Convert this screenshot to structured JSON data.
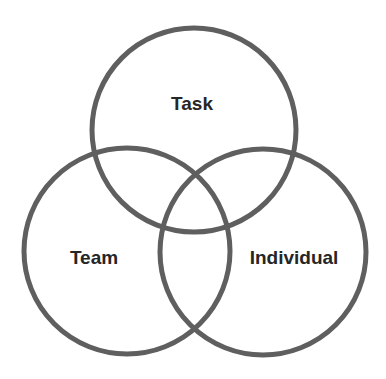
{
  "diagram": {
    "type": "venn",
    "colors": {
      "background": "#ffffff",
      "stroke": "#5f5f5f",
      "text": "#262626"
    },
    "circles": [
      {
        "id": "task",
        "label": "Task",
        "cx": 194,
        "cy": 130,
        "r": 102,
        "label_x": 192,
        "label_y": 110
      },
      {
        "id": "team",
        "label": "Team",
        "cx": 127,
        "cy": 251,
        "r": 103,
        "label_x": 94,
        "label_y": 264
      },
      {
        "id": "individual",
        "label": "Individual",
        "cx": 263,
        "cy": 252,
        "r": 103,
        "label_x": 294,
        "label_y": 264
      }
    ]
  }
}
